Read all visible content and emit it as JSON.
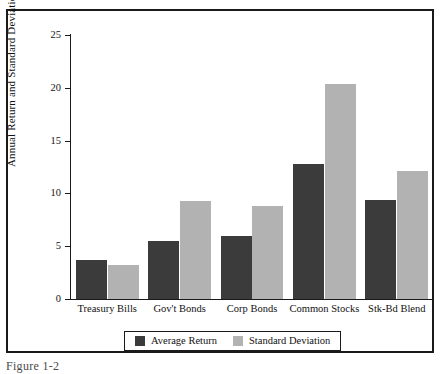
{
  "figure": {
    "caption": "Figure 1-2"
  },
  "chart_data": {
    "type": "bar",
    "title": "",
    "xlabel": "",
    "ylabel": "Annual Return and Standard Deviation (%)",
    "ylim": [
      0,
      25
    ],
    "ytick_labels": [
      "0",
      "5",
      "10",
      "15",
      "20",
      "25"
    ],
    "ytick_values": [
      0,
      5,
      10,
      15,
      20,
      25
    ],
    "grid": false,
    "legend_position": "bottom",
    "categories": [
      "Treasury Bills",
      "Gov't Bonds",
      "Corp Bonds",
      "Common Stocks",
      "Stk-Bd Blend"
    ],
    "series": [
      {
        "name": "Average Return",
        "color": "#3b3b3b",
        "values": [
          3.7,
          5.5,
          6.0,
          12.8,
          9.4
        ]
      },
      {
        "name": "Standard Deviation",
        "color": "#b2b2b2",
        "values": [
          3.2,
          9.3,
          8.8,
          20.4,
          12.1
        ]
      }
    ]
  }
}
